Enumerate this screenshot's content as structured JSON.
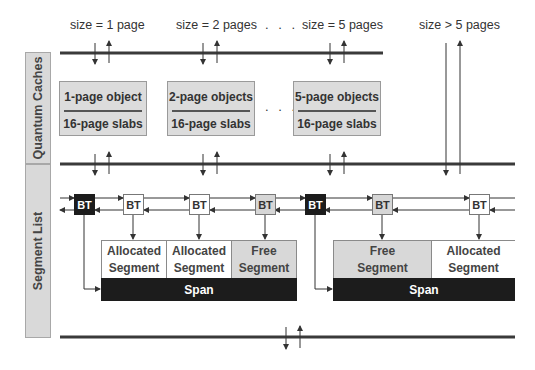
{
  "header": {
    "size_labels": [
      "size = 1 page",
      "size = 2 pages",
      "size = 5 pages",
      "size > 5 pages"
    ],
    "ellipsis": ". . ."
  },
  "sections": {
    "quantum_caches": "Quantum Caches",
    "segment_list": "Segment List"
  },
  "caches": [
    {
      "top": "1-page object",
      "bottom": "16-page slabs"
    },
    {
      "top": "2-page objects",
      "bottom": "16-page slabs"
    },
    {
      "top": "5-page objects",
      "bottom": "16-page slabs"
    }
  ],
  "boundary_tags": [
    {
      "label": "BT",
      "style": "black"
    },
    {
      "label": "BT",
      "style": "white"
    },
    {
      "label": "BT",
      "style": "white"
    },
    {
      "label": "BT",
      "style": "grey"
    },
    {
      "label": "BT",
      "style": "black"
    },
    {
      "label": "BT",
      "style": "grey"
    },
    {
      "label": "BT",
      "style": "white"
    }
  ],
  "spans": [
    {
      "label": "Span",
      "segments": [
        {
          "line1": "Allocated",
          "line2": "Segment",
          "state": "allocated"
        },
        {
          "line1": "Allocated",
          "line2": "Segment",
          "state": "allocated"
        },
        {
          "line1": "Free",
          "line2": "Segment",
          "state": "free"
        }
      ]
    },
    {
      "label": "Span",
      "segments": [
        {
          "line1": "Free",
          "line2": "Segment",
          "state": "free"
        },
        {
          "line1": "Allocated",
          "line2": "Segment",
          "state": "allocated"
        }
      ]
    }
  ],
  "colors": {
    "bar": "#3a3a3a",
    "black_fill": "#1c1c1c",
    "grey_fill": "#d8d8d8",
    "side_fill": "#d9d9d9"
  }
}
